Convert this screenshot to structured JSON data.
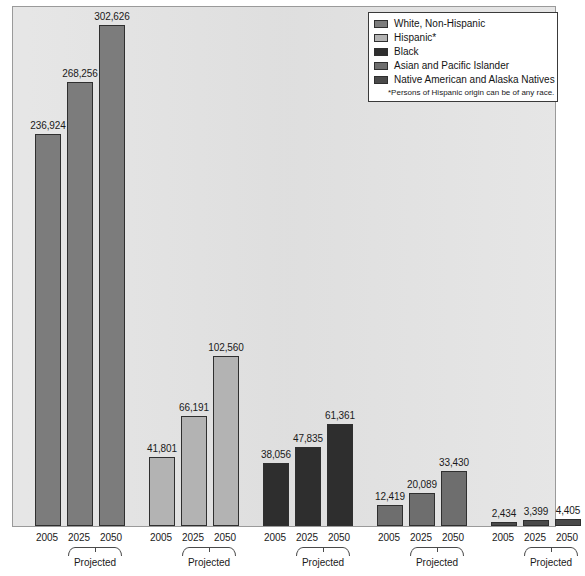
{
  "chart_data": {
    "type": "bar",
    "title": "",
    "subtitle": "",
    "xlabel": "",
    "ylabel": "",
    "categories": [
      "2005",
      "2025",
      "2050"
    ],
    "ylim": [
      0,
      302626
    ],
    "grid": false,
    "legend_position": "top-right",
    "legend_note": "*Persons of Hispanic origin can be of any race.",
    "group_sublabel": "Projected",
    "series": [
      {
        "name": "White, Non-Hispanic",
        "color": "#7c7c7c",
        "values": [
          236924,
          268256,
          302626
        ],
        "labels": [
          "236,924",
          "268,256",
          "302,626"
        ]
      },
      {
        "name": "Hispanic*",
        "color": "#b3b3b3",
        "values": [
          41801,
          66191,
          102560
        ],
        "labels": [
          "41,801",
          "66,191",
          "102,560"
        ]
      },
      {
        "name": "Black",
        "color": "#2e2e2e",
        "values": [
          38056,
          47835,
          61361
        ],
        "labels": [
          "38,056",
          "47,835",
          "61,361"
        ]
      },
      {
        "name": "Asian and Pacific Islander",
        "color": "#6e6e6e",
        "values": [
          12419,
          20089,
          33430
        ],
        "labels": [
          "12,419",
          "20,089",
          "33,430"
        ]
      },
      {
        "name": "Native American and Alaska Natives",
        "color": "#4a4a4a",
        "values": [
          2434,
          3399,
          4405
        ],
        "labels": [
          "2,434",
          "3,399",
          "4,405"
        ]
      }
    ]
  },
  "legend": {
    "items": [
      {
        "label": "White, Non-Hispanic",
        "color": "#7c7c7c"
      },
      {
        "label": "Hispanic*",
        "color": "#b3b3b3"
      },
      {
        "label": "Black",
        "color": "#2e2e2e"
      },
      {
        "label": "Asian and Pacific Islander",
        "color": "#6e6e6e"
      },
      {
        "label": "Native American and Alaska Natives",
        "color": "#4a4a4a"
      }
    ],
    "footnote": "*Persons of Hispanic origin can be of any race."
  },
  "axis": {
    "tick_labels": [
      "2005",
      "2025",
      "2050",
      "2005",
      "2025",
      "2050",
      "2005",
      "2025",
      "2050",
      "2005",
      "2025",
      "2050",
      "2005",
      "2025",
      "2050"
    ],
    "projected_label": "Projected"
  },
  "style": {
    "plot_background": "#e3e3e3",
    "plot_border": "#9a9a9a",
    "bar_outline": "#2f2f2f",
    "text_color": "#1a1a1a",
    "page_background": "#ffffff"
  }
}
